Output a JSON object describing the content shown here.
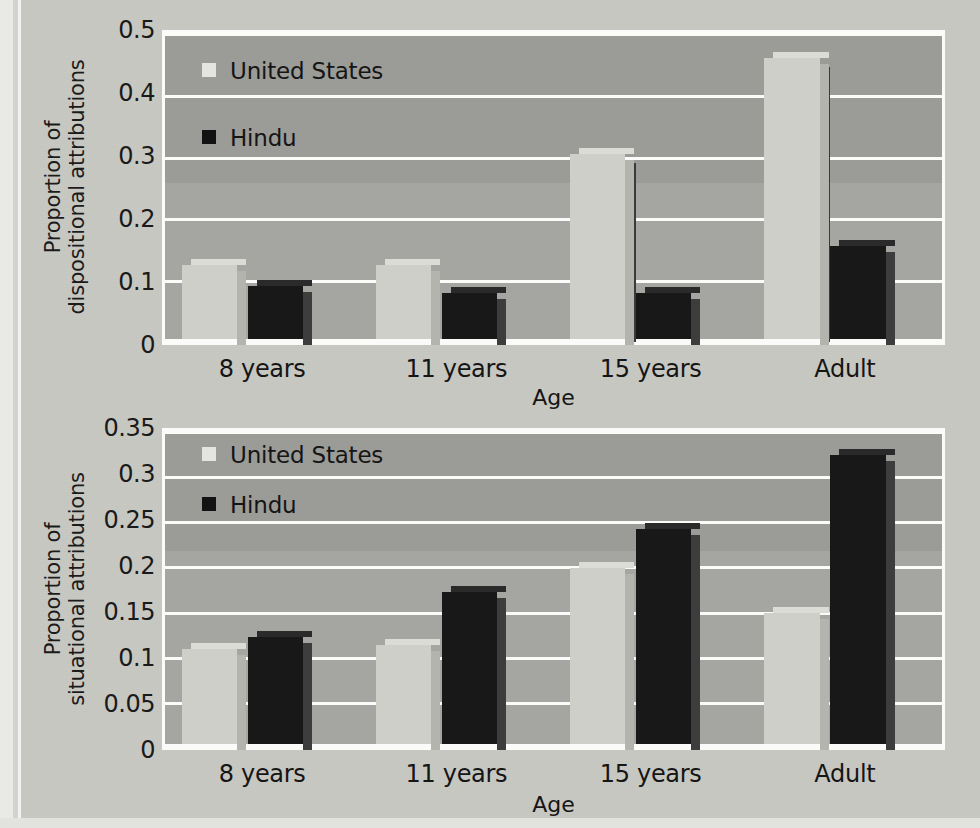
{
  "figure": {
    "background_color": "#c8c8c3",
    "plot_background_color": "#a5a5a1",
    "gridline_color": "#fbfbfa"
  },
  "series_colors": {
    "united_states": "#cfcfca",
    "hindu": "#181818"
  },
  "legend": {
    "united_states": "United States",
    "hindu": "Hindu"
  },
  "axis": {
    "x_title": "Age",
    "categories": [
      "8 years",
      "11 years",
      "15 years",
      "Adult"
    ]
  },
  "chart_data": [
    {
      "type": "bar",
      "title": "",
      "xlabel": "Age",
      "ylabel": "Proportion of dispositional attributions",
      "ylabel_line1": "Proportion of",
      "ylabel_line2": "dispositional attributions",
      "categories": [
        "8 years",
        "11 years",
        "15 years",
        "Adult"
      ],
      "ylim": [
        0,
        0.5
      ],
      "yticks": [
        "0",
        "0.1",
        "0.2",
        "0.3",
        "0.4",
        "0.5"
      ],
      "ytick_values": [
        0,
        0.1,
        0.2,
        0.3,
        0.4,
        0.5
      ],
      "grid": true,
      "legend_position": "upper-left",
      "series": [
        {
          "name": "United States",
          "values": [
            0.12,
            0.12,
            0.3,
            0.455
          ]
        },
        {
          "name": "Hindu",
          "values": [
            0.085,
            0.075,
            0.075,
            0.15
          ]
        }
      ],
      "occluded_bar_edges": [
        {
          "category": "15 years",
          "series": "Hindu",
          "edge_top": 0.29
        },
        {
          "category": "Adult",
          "series": "Hindu",
          "edge_top": 0.445
        }
      ]
    },
    {
      "type": "bar",
      "title": "",
      "xlabel": "Age",
      "ylabel": "Proportion of situational attributions",
      "ylabel_line1": "Proportion of",
      "ylabel_line2": "situational attributions",
      "categories": [
        "8 years",
        "11 years",
        "15 years",
        "Adult"
      ],
      "ylim": [
        0,
        0.35
      ],
      "yticks": [
        "0",
        "0.05",
        "0.1",
        "0.15",
        "0.2",
        "0.25",
        "0.3",
        "0.35"
      ],
      "ytick_values": [
        0,
        0.05,
        0.1,
        0.15,
        0.2,
        0.25,
        0.3,
        0.35
      ],
      "grid": true,
      "legend_position": "upper-left",
      "series": [
        {
          "name": "United States",
          "values": [
            0.105,
            0.11,
            0.195,
            0.145
          ]
        },
        {
          "name": "Hindu",
          "values": [
            0.118,
            0.168,
            0.238,
            0.32
          ]
        }
      ],
      "occluded_bar_edges": []
    }
  ]
}
